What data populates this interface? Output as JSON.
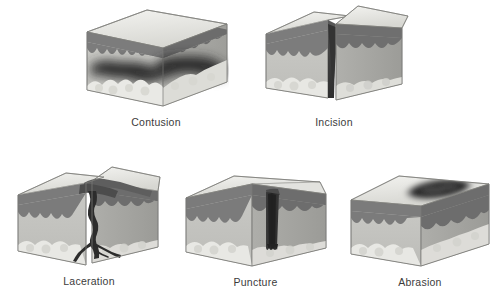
{
  "figure": {
    "background_color": "#ffffff",
    "label_color": "#3b3b3b",
    "layout": "2 panels in top row, 3 panels in bottom row"
  },
  "palette": {
    "skin_top_light": "#efefec",
    "skin_top_mid": "#dcdcd8",
    "epidermis_dark": "#7e7e7e",
    "epidermis_darker": "#6a6a6a",
    "dermis_front": "#c2c2be",
    "dermis_side": "#a9a9a5",
    "fat_light": "#e6e6e2",
    "fat_shadow": "#cfcfca",
    "wound_dark": "#2f2f2f",
    "wound_mid": "#4a4a4a",
    "outline": "#6f6f6f"
  },
  "panels": [
    {
      "id": "contusion",
      "label": "Contusion",
      "row": 1,
      "column": 1,
      "wound_description": "Diffuse dark bruise band spread horizontally through the dermis beneath intact skin surface",
      "surface_broken": false
    },
    {
      "id": "incision",
      "label": "Incision",
      "row": 1,
      "column": 2,
      "wound_description": "Clean narrow V-shaped cut splitting the skin block into two separated halves",
      "surface_broken": true
    },
    {
      "id": "laceration",
      "label": "Laceration",
      "row": 2,
      "column": 1,
      "wound_description": "Jagged irregular tear with ragged overhanging skin flaps and branching split into the dermis",
      "surface_broken": true
    },
    {
      "id": "puncture",
      "label": "Puncture",
      "row": 2,
      "column": 2,
      "wound_description": "Narrow deep vertical channel penetrating from the surface through the dermis to the fat layer",
      "surface_broken": true
    },
    {
      "id": "abrasion",
      "label": "Abrasion",
      "row": 2,
      "column": 3,
      "wound_description": "Elliptical dark scraped patch confined to the surface of the epidermis",
      "surface_broken": true
    }
  ]
}
